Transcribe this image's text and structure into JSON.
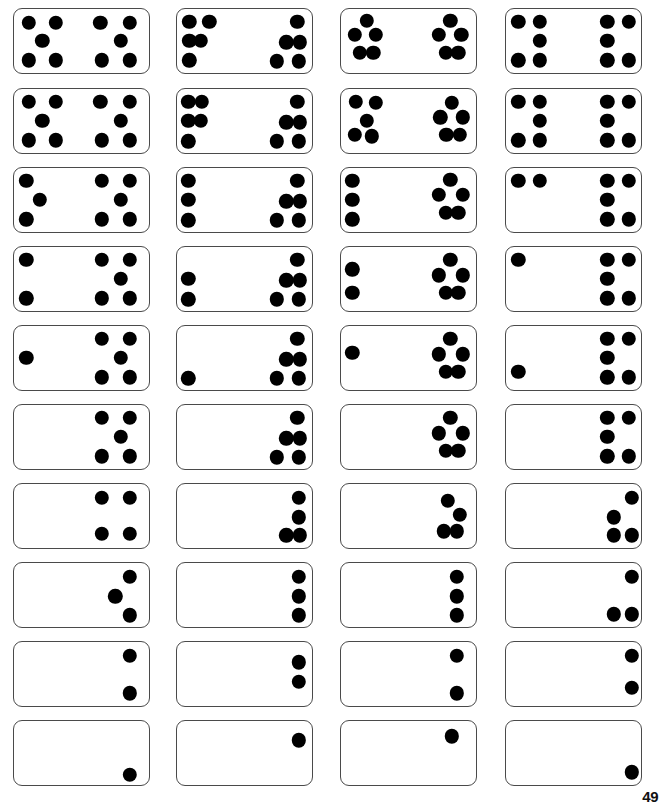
{
  "page": {
    "page_number": "49",
    "background_color": "#ffffff",
    "pip_color": "#000000",
    "tile_border_color": "#4a4a4a",
    "columns": 4,
    "rows": 10,
    "total_dominoes": 40
  },
  "layout": {
    "column_x": [
      13,
      176,
      340,
      505
    ],
    "row_y": [
      8,
      88,
      167,
      246,
      325,
      404,
      483,
      562,
      641,
      720
    ],
    "tile_width": 137,
    "tile_height": 66,
    "pip_radius": 7.2
  },
  "dominoes": [
    {
      "id": "r1c1",
      "row": 1,
      "col": 1,
      "left_value": 5,
      "right_value": 5,
      "left_pips": [
        [
          0.22,
          0.22
        ],
        [
          0.62,
          0.22
        ],
        [
          0.42,
          0.5
        ],
        [
          0.22,
          0.8
        ],
        [
          0.62,
          0.8
        ]
      ],
      "right_pips": [
        [
          0.28,
          0.22
        ],
        [
          0.72,
          0.22
        ],
        [
          0.58,
          0.5
        ],
        [
          0.3,
          0.8
        ],
        [
          0.72,
          0.8
        ]
      ]
    },
    {
      "id": "r1c2",
      "row": 1,
      "col": 2,
      "left_value": 5,
      "right_value": 5,
      "left_pips": [
        [
          0.18,
          0.2
        ],
        [
          0.48,
          0.2
        ],
        [
          0.18,
          0.5
        ],
        [
          0.35,
          0.5
        ],
        [
          0.18,
          0.8
        ]
      ],
      "right_pips": [
        [
          0.78,
          0.2
        ],
        [
          0.62,
          0.52
        ],
        [
          0.82,
          0.52
        ],
        [
          0.48,
          0.82
        ],
        [
          0.8,
          0.82
        ]
      ]
    },
    {
      "id": "r1c3",
      "row": 1,
      "col": 3,
      "left_value": 5,
      "right_value": 5,
      "left_pips": [
        [
          0.38,
          0.18
        ],
        [
          0.2,
          0.4
        ],
        [
          0.52,
          0.4
        ],
        [
          0.28,
          0.68
        ],
        [
          0.48,
          0.68
        ]
      ],
      "right_pips": [
        [
          0.62,
          0.18
        ],
        [
          0.45,
          0.4
        ],
        [
          0.78,
          0.4
        ],
        [
          0.55,
          0.68
        ],
        [
          0.74,
          0.68
        ]
      ]
    },
    {
      "id": "r1c4",
      "row": 1,
      "col": 4,
      "left_value": 5,
      "right_value": 5,
      "left_pips": [
        [
          0.18,
          0.2
        ],
        [
          0.5,
          0.2
        ],
        [
          0.5,
          0.5
        ],
        [
          0.18,
          0.8
        ],
        [
          0.5,
          0.8
        ]
      ],
      "right_pips": [
        [
          0.5,
          0.2
        ],
        [
          0.82,
          0.2
        ],
        [
          0.5,
          0.5
        ],
        [
          0.5,
          0.8
        ],
        [
          0.82,
          0.8
        ]
      ]
    },
    {
      "id": "r2c1",
      "row": 2,
      "col": 1,
      "left_value": 5,
      "right_value": 5,
      "left_pips": [
        [
          0.22,
          0.2
        ],
        [
          0.62,
          0.2
        ],
        [
          0.42,
          0.5
        ],
        [
          0.22,
          0.8
        ],
        [
          0.62,
          0.8
        ]
      ],
      "right_pips": [
        [
          0.28,
          0.2
        ],
        [
          0.72,
          0.2
        ],
        [
          0.58,
          0.5
        ],
        [
          0.3,
          0.8
        ],
        [
          0.72,
          0.8
        ]
      ]
    },
    {
      "id": "r2c2",
      "row": 2,
      "col": 2,
      "left_value": 5,
      "right_value": 5,
      "left_pips": [
        [
          0.17,
          0.2
        ],
        [
          0.37,
          0.2
        ],
        [
          0.17,
          0.5
        ],
        [
          0.17,
          0.82
        ],
        [
          0.35,
          0.5
        ]
      ],
      "right_pips": [
        [
          0.78,
          0.2
        ],
        [
          0.62,
          0.52
        ],
        [
          0.82,
          0.52
        ],
        [
          0.48,
          0.82
        ],
        [
          0.8,
          0.82
        ]
      ]
    },
    {
      "id": "r2c3",
      "row": 2,
      "col": 3,
      "left_value": 5,
      "right_value": 5,
      "left_pips": [
        [
          0.22,
          0.2
        ],
        [
          0.52,
          0.22
        ],
        [
          0.38,
          0.5
        ],
        [
          0.2,
          0.72
        ],
        [
          0.46,
          0.74
        ]
      ],
      "right_pips": [
        [
          0.64,
          0.22
        ],
        [
          0.47,
          0.44
        ],
        [
          0.8,
          0.44
        ],
        [
          0.56,
          0.72
        ],
        [
          0.76,
          0.72
        ]
      ]
    },
    {
      "id": "r2c4",
      "row": 2,
      "col": 4,
      "left_value": 5,
      "right_value": 5,
      "left_pips": [
        [
          0.18,
          0.2
        ],
        [
          0.5,
          0.2
        ],
        [
          0.5,
          0.5
        ],
        [
          0.18,
          0.8
        ],
        [
          0.5,
          0.8
        ]
      ],
      "right_pips": [
        [
          0.5,
          0.2
        ],
        [
          0.82,
          0.2
        ],
        [
          0.5,
          0.5
        ],
        [
          0.5,
          0.8
        ],
        [
          0.82,
          0.8
        ]
      ]
    },
    {
      "id": "r3c1",
      "row": 3,
      "col": 1,
      "left_value": 3,
      "right_value": 5,
      "left_pips": [
        [
          0.18,
          0.2
        ],
        [
          0.38,
          0.5
        ],
        [
          0.18,
          0.8
        ]
      ],
      "right_pips": [
        [
          0.3,
          0.2
        ],
        [
          0.72,
          0.2
        ],
        [
          0.58,
          0.5
        ],
        [
          0.3,
          0.8
        ],
        [
          0.72,
          0.8
        ]
      ]
    },
    {
      "id": "r3c2",
      "row": 3,
      "col": 2,
      "left_value": 3,
      "right_value": 5,
      "left_pips": [
        [
          0.17,
          0.2
        ],
        [
          0.17,
          0.5
        ],
        [
          0.17,
          0.82
        ]
      ],
      "right_pips": [
        [
          0.78,
          0.2
        ],
        [
          0.62,
          0.52
        ],
        [
          0.82,
          0.52
        ],
        [
          0.48,
          0.82
        ],
        [
          0.8,
          0.82
        ]
      ]
    },
    {
      "id": "r3c3",
      "row": 3,
      "col": 3,
      "left_value": 3,
      "right_value": 5,
      "left_pips": [
        [
          0.17,
          0.2
        ],
        [
          0.17,
          0.5
        ],
        [
          0.17,
          0.8
        ]
      ],
      "right_pips": [
        [
          0.62,
          0.18
        ],
        [
          0.45,
          0.42
        ],
        [
          0.8,
          0.42
        ],
        [
          0.55,
          0.7
        ],
        [
          0.74,
          0.7
        ]
      ]
    },
    {
      "id": "r3c4",
      "row": 3,
      "col": 4,
      "left_value": 2,
      "right_value": 5,
      "left_pips": [
        [
          0.18,
          0.2
        ],
        [
          0.5,
          0.2
        ]
      ],
      "right_pips": [
        [
          0.5,
          0.2
        ],
        [
          0.82,
          0.2
        ],
        [
          0.5,
          0.5
        ],
        [
          0.5,
          0.8
        ],
        [
          0.82,
          0.8
        ]
      ]
    },
    {
      "id": "r4c1",
      "row": 4,
      "col": 1,
      "left_value": 2,
      "right_value": 5,
      "left_pips": [
        [
          0.18,
          0.2
        ],
        [
          0.18,
          0.8
        ]
      ],
      "right_pips": [
        [
          0.3,
          0.2
        ],
        [
          0.72,
          0.2
        ],
        [
          0.58,
          0.5
        ],
        [
          0.3,
          0.8
        ],
        [
          0.72,
          0.8
        ]
      ]
    },
    {
      "id": "r4c2",
      "row": 4,
      "col": 2,
      "left_value": 2,
      "right_value": 5,
      "left_pips": [
        [
          0.17,
          0.5
        ],
        [
          0.17,
          0.82
        ]
      ],
      "right_pips": [
        [
          0.78,
          0.2
        ],
        [
          0.62,
          0.52
        ],
        [
          0.82,
          0.52
        ],
        [
          0.48,
          0.82
        ],
        [
          0.8,
          0.82
        ]
      ]
    },
    {
      "id": "r4c3",
      "row": 4,
      "col": 3,
      "left_value": 2,
      "right_value": 5,
      "left_pips": [
        [
          0.17,
          0.35
        ],
        [
          0.17,
          0.72
        ]
      ],
      "right_pips": [
        [
          0.62,
          0.2
        ],
        [
          0.45,
          0.44
        ],
        [
          0.8,
          0.44
        ],
        [
          0.55,
          0.72
        ],
        [
          0.74,
          0.72
        ]
      ]
    },
    {
      "id": "r4c4",
      "row": 4,
      "col": 4,
      "left_value": 1,
      "right_value": 5,
      "left_pips": [
        [
          0.18,
          0.2
        ]
      ],
      "right_pips": [
        [
          0.5,
          0.2
        ],
        [
          0.82,
          0.2
        ],
        [
          0.5,
          0.5
        ],
        [
          0.5,
          0.8
        ],
        [
          0.82,
          0.8
        ]
      ]
    },
    {
      "id": "r5c1",
      "row": 5,
      "col": 1,
      "left_value": 1,
      "right_value": 5,
      "left_pips": [
        [
          0.18,
          0.5
        ]
      ],
      "right_pips": [
        [
          0.3,
          0.2
        ],
        [
          0.72,
          0.2
        ],
        [
          0.58,
          0.5
        ],
        [
          0.3,
          0.8
        ],
        [
          0.72,
          0.8
        ]
      ]
    },
    {
      "id": "r5c2",
      "row": 5,
      "col": 2,
      "left_value": 1,
      "right_value": 5,
      "left_pips": [
        [
          0.17,
          0.82
        ]
      ],
      "right_pips": [
        [
          0.78,
          0.2
        ],
        [
          0.62,
          0.52
        ],
        [
          0.82,
          0.52
        ],
        [
          0.48,
          0.82
        ],
        [
          0.8,
          0.82
        ]
      ]
    },
    {
      "id": "r5c3",
      "row": 5,
      "col": 3,
      "left_value": 1,
      "right_value": 5,
      "left_pips": [
        [
          0.17,
          0.42
        ]
      ],
      "right_pips": [
        [
          0.62,
          0.2
        ],
        [
          0.45,
          0.44
        ],
        [
          0.8,
          0.44
        ],
        [
          0.55,
          0.72
        ],
        [
          0.74,
          0.72
        ]
      ]
    },
    {
      "id": "r5c4",
      "row": 5,
      "col": 4,
      "left_value": 1,
      "right_value": 5,
      "left_pips": [
        [
          0.18,
          0.72
        ]
      ],
      "right_pips": [
        [
          0.5,
          0.2
        ],
        [
          0.82,
          0.2
        ],
        [
          0.5,
          0.5
        ],
        [
          0.5,
          0.8
        ],
        [
          0.82,
          0.8
        ]
      ]
    },
    {
      "id": "r6c1",
      "row": 6,
      "col": 1,
      "left_value": 0,
      "right_value": 5,
      "left_pips": [],
      "right_pips": [
        [
          0.3,
          0.2
        ],
        [
          0.72,
          0.2
        ],
        [
          0.58,
          0.5
        ],
        [
          0.3,
          0.8
        ],
        [
          0.72,
          0.8
        ]
      ]
    },
    {
      "id": "r6c2",
      "row": 6,
      "col": 2,
      "left_value": 0,
      "right_value": 5,
      "left_pips": [],
      "right_pips": [
        [
          0.78,
          0.2
        ],
        [
          0.62,
          0.52
        ],
        [
          0.82,
          0.52
        ],
        [
          0.48,
          0.82
        ],
        [
          0.8,
          0.82
        ]
      ]
    },
    {
      "id": "r6c3",
      "row": 6,
      "col": 3,
      "left_value": 0,
      "right_value": 5,
      "left_pips": [],
      "right_pips": [
        [
          0.62,
          0.2
        ],
        [
          0.45,
          0.44
        ],
        [
          0.8,
          0.44
        ],
        [
          0.55,
          0.72
        ],
        [
          0.74,
          0.72
        ]
      ]
    },
    {
      "id": "r6c4",
      "row": 6,
      "col": 4,
      "left_value": 0,
      "right_value": 5,
      "left_pips": [],
      "right_pips": [
        [
          0.5,
          0.2
        ],
        [
          0.82,
          0.2
        ],
        [
          0.5,
          0.5
        ],
        [
          0.5,
          0.8
        ],
        [
          0.82,
          0.8
        ]
      ]
    },
    {
      "id": "r7c1",
      "row": 7,
      "col": 1,
      "left_value": 0,
      "right_value": 4,
      "left_pips": [],
      "right_pips": [
        [
          0.3,
          0.22
        ],
        [
          0.72,
          0.22
        ],
        [
          0.3,
          0.78
        ],
        [
          0.72,
          0.78
        ]
      ]
    },
    {
      "id": "r7c2",
      "row": 7,
      "col": 2,
      "left_value": 0,
      "right_value": 4,
      "left_pips": [],
      "right_pips": [
        [
          0.8,
          0.22
        ],
        [
          0.8,
          0.52
        ],
        [
          0.62,
          0.8
        ],
        [
          0.82,
          0.8
        ]
      ]
    },
    {
      "id": "r7c3",
      "row": 7,
      "col": 3,
      "left_value": 0,
      "right_value": 4,
      "left_pips": [],
      "right_pips": [
        [
          0.58,
          0.26
        ],
        [
          0.76,
          0.48
        ],
        [
          0.52,
          0.74
        ],
        [
          0.72,
          0.74
        ]
      ]
    },
    {
      "id": "r7c4",
      "row": 7,
      "col": 4,
      "left_value": 0,
      "right_value": 4,
      "left_pips": [],
      "right_pips": [
        [
          0.86,
          0.22
        ],
        [
          0.6,
          0.52
        ],
        [
          0.6,
          0.8
        ],
        [
          0.86,
          0.8
        ]
      ]
    },
    {
      "id": "r8c1",
      "row": 8,
      "col": 1,
      "left_value": 0,
      "right_value": 3,
      "left_pips": [],
      "right_pips": [
        [
          0.72,
          0.22
        ],
        [
          0.5,
          0.52
        ],
        [
          0.72,
          0.82
        ]
      ]
    },
    {
      "id": "r8c2",
      "row": 8,
      "col": 2,
      "left_value": 0,
      "right_value": 3,
      "left_pips": [],
      "right_pips": [
        [
          0.8,
          0.22
        ],
        [
          0.8,
          0.52
        ],
        [
          0.8,
          0.82
        ]
      ]
    },
    {
      "id": "r8c3",
      "row": 8,
      "col": 3,
      "left_value": 0,
      "right_value": 3,
      "left_pips": [],
      "right_pips": [
        [
          0.72,
          0.22
        ],
        [
          0.72,
          0.52
        ],
        [
          0.72,
          0.82
        ]
      ]
    },
    {
      "id": "r8c4",
      "row": 8,
      "col": 4,
      "left_value": 0,
      "right_value": 3,
      "left_pips": [],
      "right_pips": [
        [
          0.86,
          0.22
        ],
        [
          0.6,
          0.8
        ],
        [
          0.86,
          0.8
        ]
      ]
    },
    {
      "id": "r9c1",
      "row": 9,
      "col": 1,
      "left_value": 0,
      "right_value": 2,
      "left_pips": [],
      "right_pips": [
        [
          0.72,
          0.22
        ],
        [
          0.72,
          0.8
        ]
      ]
    },
    {
      "id": "r9c2",
      "row": 9,
      "col": 2,
      "left_value": 0,
      "right_value": 2,
      "left_pips": [],
      "right_pips": [
        [
          0.8,
          0.32
        ],
        [
          0.8,
          0.62
        ]
      ]
    },
    {
      "id": "r9c3",
      "row": 9,
      "col": 3,
      "left_value": 0,
      "right_value": 2,
      "left_pips": [],
      "right_pips": [
        [
          0.72,
          0.22
        ],
        [
          0.72,
          0.8
        ]
      ]
    },
    {
      "id": "r9c4",
      "row": 9,
      "col": 4,
      "left_value": 0,
      "right_value": 2,
      "left_pips": [],
      "right_pips": [
        [
          0.86,
          0.22
        ],
        [
          0.86,
          0.72
        ]
      ]
    },
    {
      "id": "r10c1",
      "row": 10,
      "col": 1,
      "left_value": 0,
      "right_value": 1,
      "left_pips": [],
      "right_pips": [
        [
          0.72,
          0.84
        ]
      ]
    },
    {
      "id": "r10c2",
      "row": 10,
      "col": 2,
      "left_value": 0,
      "right_value": 1,
      "left_pips": [],
      "right_pips": [
        [
          0.8,
          0.3
        ]
      ]
    },
    {
      "id": "r10c3",
      "row": 10,
      "col": 3,
      "left_value": 0,
      "right_value": 1,
      "left_pips": [],
      "right_pips": [
        [
          0.64,
          0.24
        ]
      ]
    },
    {
      "id": "r10c4",
      "row": 10,
      "col": 4,
      "left_value": 0,
      "right_value": 1,
      "left_pips": [],
      "right_pips": [
        [
          0.86,
          0.8
        ]
      ]
    }
  ]
}
